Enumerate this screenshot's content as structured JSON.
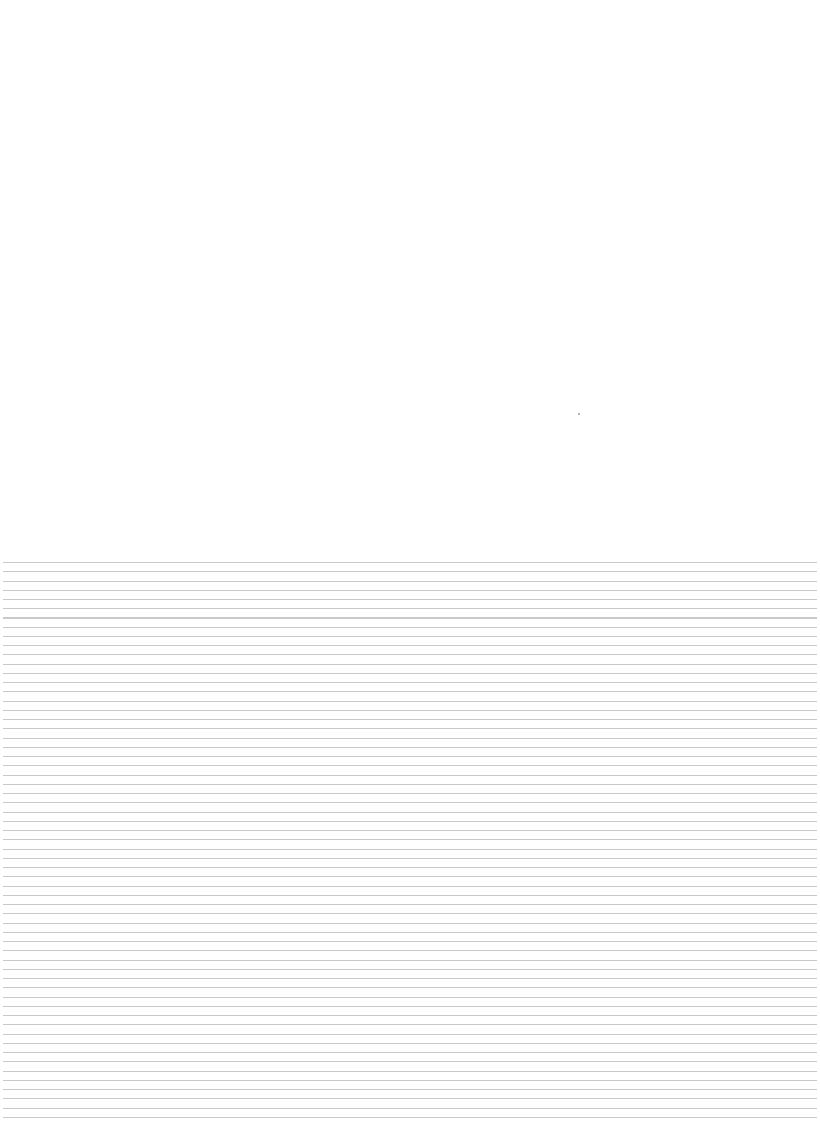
{
  "page": {
    "background_color": "#ffffff",
    "top_section": {
      "content": ""
    },
    "marks": [
      {
        "x": 578,
        "y": 413,
        "color": "#9a9a9a"
      }
    ],
    "ruled_section": {
      "line_color": "#c9c9c9",
      "line_spacing_px": 9.25,
      "line_count": 61,
      "start_y": 562,
      "end_y": 1117
    }
  }
}
